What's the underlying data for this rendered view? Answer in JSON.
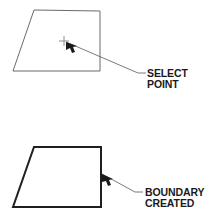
{
  "figure": {
    "title": "",
    "background_color": "#ffffff",
    "line_color": "#4d4d4d",
    "bold_line_color": "#1a1a1a",
    "text_color": "#1a1a1a",
    "width": 212,
    "height": 219
  },
  "panels": [
    {
      "id": "select-point-panel",
      "shape_name": "quadrilateral-thin",
      "shape_points": "34,10 100,11 100,71 13,71",
      "line_weight": "thin",
      "marker": {
        "name": "crosshair-marker",
        "x": 64,
        "y": 41,
        "arm": 5
      },
      "cursor": {
        "name": "arrow-cursor",
        "tip_x": 66,
        "tip_y": 42
      },
      "leader": {
        "elbow": "66,42 138,73 146,73"
      },
      "label_lines": [
        "SELECT",
        "POINT"
      ],
      "label_x": 147,
      "label_y1": 77,
      "label_y2": 88
    },
    {
      "id": "boundary-created-panel",
      "shape_name": "quadrilateral-bold",
      "shape_points": "34,147 101,147 101,207 13,207",
      "line_weight": "bold",
      "cursor": {
        "name": "arrow-cursor",
        "tip_x": 102,
        "tip_y": 174
      },
      "leader": {
        "elbow": "102,174 135,192 143,192"
      },
      "label_lines": [
        "BOUNDARY",
        "CREATED"
      ],
      "label_x": 145,
      "label_y1": 196,
      "label_y2": 207
    }
  ]
}
